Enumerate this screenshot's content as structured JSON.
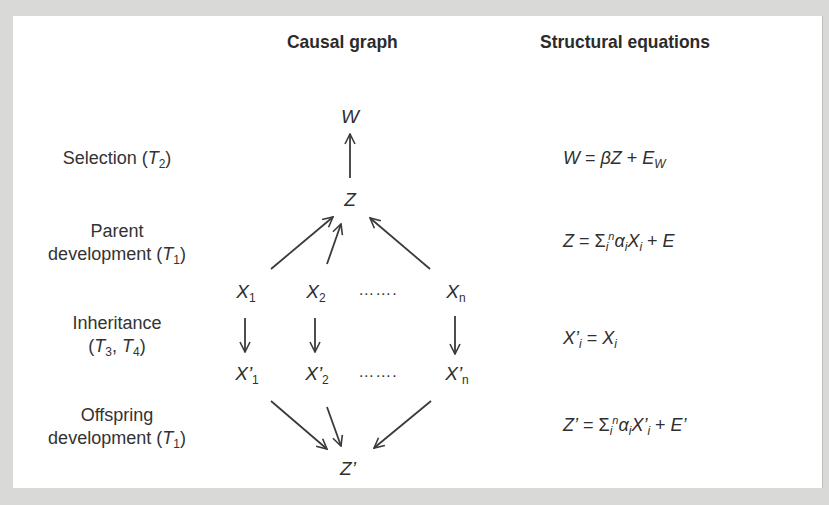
{
  "headers": {
    "causal_graph": "Causal graph",
    "structural_equations": "Structural equations"
  },
  "stages": [
    {
      "id": "selection",
      "line1": "Selection (",
      "var": "T",
      "sub": "2",
      "line1_end": ")"
    },
    {
      "id": "parent-development",
      "line1": "Parent",
      "line2": "development (",
      "var": "T",
      "sub": "1",
      "line2_end": ")"
    },
    {
      "id": "inheritance",
      "line1": "Inheritance",
      "line2_pre": "(",
      "var": "T",
      "sub": "3",
      "sep": ", ",
      "var2": "T",
      "sub2": "4",
      "line2_end": ")"
    },
    {
      "id": "offspring-development",
      "line1": "Offspring",
      "line2": "development (",
      "var": "T",
      "sub": "1",
      "line2_end": ")"
    }
  ],
  "graph": {
    "nodes": {
      "W": {
        "label": "W"
      },
      "Z": {
        "label": "Z"
      },
      "X1": {
        "label": "X",
        "sub": "1"
      },
      "X2": {
        "label": "X",
        "sub": "2"
      },
      "Xn": {
        "label": "X",
        "sub": "n"
      },
      "X1p": {
        "label": "X’",
        "sub": "1"
      },
      "X2p": {
        "label": "X’",
        "sub": "2"
      },
      "Xnp": {
        "label": "X’",
        "sub": "n"
      },
      "Zp": {
        "label": "Z’"
      }
    },
    "ellipsis": "…….",
    "edges": [
      {
        "from": "Z",
        "to": "W"
      },
      {
        "from": "X1",
        "to": "Z"
      },
      {
        "from": "X2",
        "to": "Z"
      },
      {
        "from": "Xn",
        "to": "Z"
      },
      {
        "from": "X1",
        "to": "X1p"
      },
      {
        "from": "X2",
        "to": "X2p"
      },
      {
        "from": "Xn",
        "to": "Xnp"
      },
      {
        "from": "X1p",
        "to": "Zp"
      },
      {
        "from": "X2p",
        "to": "Zp"
      },
      {
        "from": "Xnp",
        "to": "Zp"
      }
    ]
  },
  "equations": {
    "selection": {
      "text": "W = βZ + E_W"
    },
    "parent_development": {
      "text": "Z = Σ_i^n α_i X_i + E"
    },
    "inheritance": {
      "text": "X'_i = X_i"
    },
    "offspring_development": {
      "text": "Z' = Σ_i^n α_i X'_i + E'"
    }
  },
  "eq_parts": {
    "W": "W",
    "eq": " = ",
    "beta": "β",
    "Z": "Z",
    "plus": " + ",
    "E": "E",
    "Wsub": "W",
    "sigma": "Σ",
    "i": "i",
    "n": "n",
    "alpha": "α",
    "X": "X",
    "Xp": "X’",
    "Zp": "Z’",
    "Ep": "E’"
  },
  "colors": {
    "background_frame": "#d9d9d7",
    "panel": "#ffffff",
    "ink": "#2f2f2f"
  }
}
